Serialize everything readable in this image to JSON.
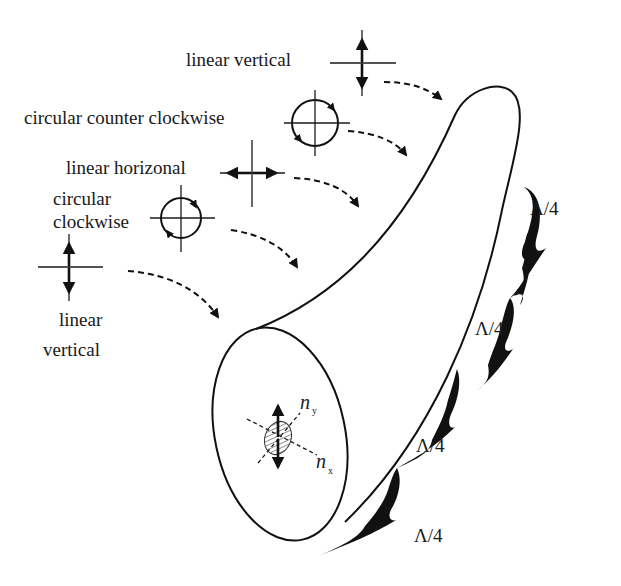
{
  "diagram": {
    "type": "polarization-maintaining fiber rocking filter schematic",
    "labels": {
      "linear_vertical_top": "linear vertical",
      "circular_ccw": "circular counter clockwise",
      "linear_horizontal": "linear horizonal",
      "circular_cw_line1": "circular",
      "circular_cw_line2": "clockwise",
      "linear_vertical_bottom_line1": "linear",
      "linear_vertical_bottom_line2": "vertical"
    },
    "axes": {
      "ny_main": "n",
      "ny_sub": "y",
      "nx_main": "n",
      "nx_sub": "x"
    },
    "segments": [
      {
        "label": "Λ/4"
      },
      {
        "label": "Λ/4"
      },
      {
        "label": "Λ/4"
      },
      {
        "label": "Λ/4"
      }
    ],
    "colors": {
      "ink": "#111111",
      "background": "#ffffff",
      "hatch": "#555555"
    }
  }
}
